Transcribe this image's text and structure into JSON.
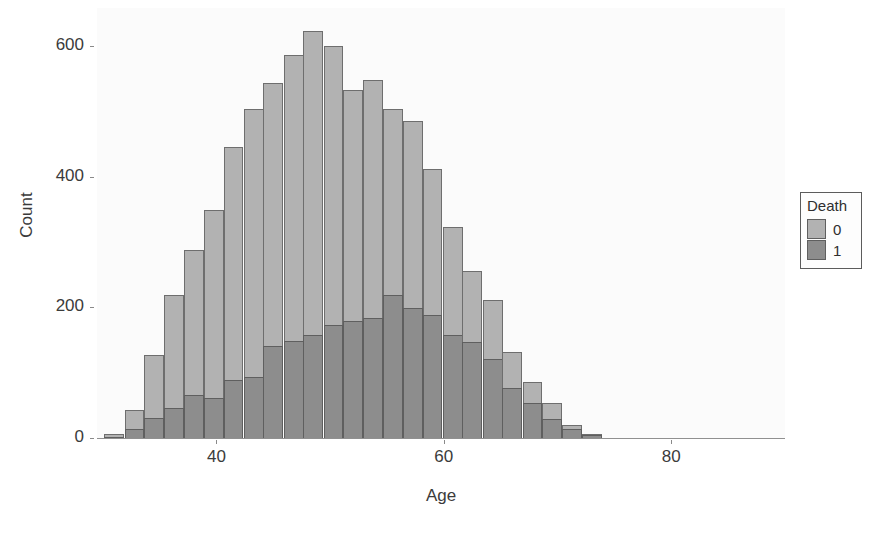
{
  "chart_data": {
    "type": "bar",
    "title": "",
    "xlabel": "Age",
    "ylabel": "Count",
    "xlim": [
      29.5,
      90
    ],
    "ylim": [
      0,
      660
    ],
    "xticks": [
      40,
      60,
      80
    ],
    "yticks": [
      0,
      200,
      400,
      600
    ],
    "grid": false,
    "stacked": true,
    "bin_width": 1.75,
    "legend": {
      "title": "Death",
      "position": "right",
      "entries": [
        {
          "label": "0",
          "color": "#b2b2b2"
        },
        {
          "label": "1",
          "color": "#8d8d8d"
        }
      ]
    },
    "bin_centers": [
      31.0,
      32.8,
      34.5,
      36.3,
      38.0,
      39.8,
      41.5,
      43.3,
      45.0,
      46.8,
      48.5,
      50.3,
      52.0,
      53.8,
      55.5,
      57.3,
      59.0,
      60.8,
      62.5,
      64.3,
      66.0,
      67.8,
      69.5,
      71.3,
      73.0
    ],
    "series": [
      {
        "name": "0",
        "color": "#b2b2b2",
        "values": [
          8,
          45,
          128,
          220,
          289,
          350,
          447,
          505,
          545,
          588,
          625,
          602,
          535,
          550,
          505,
          487,
          413,
          325,
          258,
          213,
          133,
          88,
          55,
          22,
          8
        ]
      },
      {
        "name": "1",
        "color": "#8d8d8d",
        "values": [
          3,
          15,
          32,
          48,
          68,
          63,
          90,
          95,
          142,
          150,
          160,
          175,
          180,
          185,
          220,
          200,
          190,
          160,
          148,
          123,
          78,
          55,
          30,
          15,
          6
        ]
      }
    ]
  }
}
